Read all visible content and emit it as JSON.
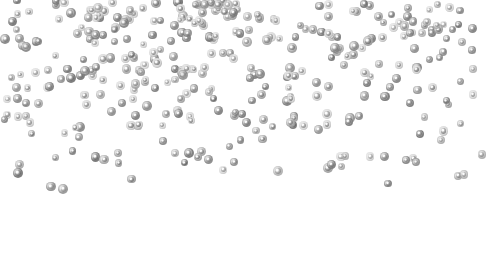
{
  "scene": {
    "description": "Silver glitter confetti dots scattered on a white background, dense at the top and thinning toward the bottom",
    "background": "#ffffff",
    "width": 489,
    "height": 275
  },
  "confetti": {
    "color_dark": "#7a7a7a",
    "color_mid": "#a6a6a6",
    "color_light": "#d4d4d4",
    "dot_size_min": 7,
    "dot_size_max": 10,
    "bands": [
      {
        "y_start": 0,
        "y_end": 40,
        "count": 130
      },
      {
        "y_start": 40,
        "y_end": 90,
        "count": 110
      },
      {
        "y_start": 90,
        "y_end": 135,
        "count": 70
      },
      {
        "y_start": 135,
        "y_end": 170,
        "count": 32
      },
      {
        "y_start": 170,
        "y_end": 190,
        "count": 8
      }
    ],
    "seed": 7
  }
}
